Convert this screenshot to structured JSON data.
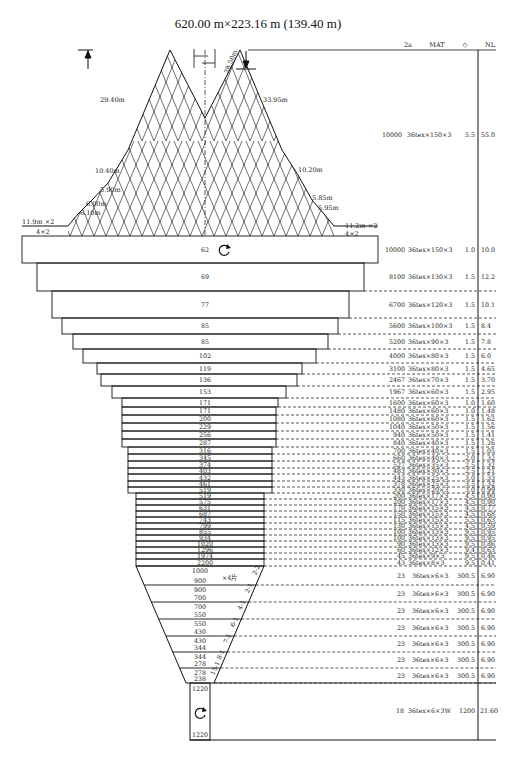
{
  "title": "620.00 m×223.16 m (139.40 m)",
  "table_header": {
    "col_2a": "2a",
    "col_mat": "MAT",
    "col_diamond": "◇",
    "col_nl": "NL"
  },
  "wing_labels": {
    "left": [
      "29.40m",
      "10.40m",
      "5.90m",
      "6.00m",
      "6.10m",
      "11.9m ×2",
      "4×2"
    ],
    "right": [
      "33.95m",
      "10.20m",
      "5.85m",
      "5.95m",
      "11.2m ×2",
      "4×2"
    ],
    "center": "28.50m"
  },
  "wing_row": {
    "a2": "10000",
    "mat": "36tex×150×3",
    "d": "5.5",
    "nl": "55.0"
  },
  "body_sections": [
    {
      "mesh": "62",
      "a2": "10000",
      "mat": "36tex×150×3",
      "d": "1.0",
      "nl": "10.0"
    },
    {
      "mesh": "69",
      "a2": "8100",
      "mat": "36tex×130×3",
      "d": "1.5",
      "nl": "12.2"
    },
    {
      "mesh": "77",
      "a2": "6700",
      "mat": "36tex×120×3",
      "d": "1.5",
      "nl": "10.1"
    },
    {
      "mesh": "85",
      "a2": "5600",
      "mat": "36tex×100×3",
      "d": "1.5",
      "nl": "8.4"
    },
    {
      "mesh": "85",
      "a2": "5200",
      "mat": "36tex×90×3",
      "d": "1.5",
      "nl": "7.8"
    },
    {
      "mesh": "102",
      "a2": "4000",
      "mat": "36tex×80×3",
      "d": "1.5",
      "nl": "6.0"
    },
    {
      "mesh": "119",
      "a2": "3100",
      "mat": "36tex×80×3",
      "d": "1.5",
      "nl": "4.65"
    },
    {
      "mesh": "136",
      "a2": "2467",
      "mat": "36tex×70×3",
      "d": "1.5",
      "nl": "3.70"
    },
    {
      "mesh": "153",
      "a2": "1967",
      "mat": "36tex×60×3",
      "d": "1.5",
      "nl": "2.95"
    },
    {
      "mesh": "171",
      "a2": "1600",
      "mat": "36tex×60×3",
      "d": "1.0",
      "nl": "1.60"
    },
    {
      "mesh": "171",
      "a2": "1480",
      "mat": "36tex×60×3",
      "d": "1.0",
      "nl": "1.48"
    },
    {
      "mesh": "200",
      "a2": "1080",
      "mat": "36tex×60×3",
      "d": "1.5",
      "nl": "1.62"
    },
    {
      "mesh": "229",
      "a2": "1040",
      "mat": "36tex×50×3",
      "d": "1.5",
      "nl": "1.56"
    },
    {
      "mesh": "256",
      "a2": "940",
      "mat": "36tex×50×3",
      "d": "1.5",
      "nl": "1.41"
    },
    {
      "mesh": "287",
      "a2": "840",
      "mat": "36tex×40×3",
      "d": "1.5",
      "nl": "1.26"
    },
    {
      "mesh": "316",
      "a2": "700",
      "mat": "36tex×40×3",
      "d": "1.5",
      "nl": "1.05"
    },
    {
      "mesh": "345",
      "a2": "660",
      "mat": "36tex×40×3",
      "d": "2.0",
      "nl": "1.32"
    },
    {
      "mesh": "374",
      "a2": "527",
      "mat": "36tex×35×3",
      "d": "2.5",
      "nl": "1.32"
    },
    {
      "mesh": "403",
      "a2": "483",
      "mat": "36tex×30×3",
      "d": "2.5",
      "nl": "1.21"
    },
    {
      "mesh": "432",
      "a2": "443",
      "mat": "36tex×25×3",
      "d": "3.0",
      "nl": "1.33"
    },
    {
      "mesh": "461",
      "a2": "378",
      "mat": "36tex×25×3",
      "d": "3.5",
      "nl": "1.32"
    },
    {
      "mesh": "519",
      "a2": "330",
      "mat": "36tex×20×3",
      "d": "3.0",
      "nl": "0.99"
    },
    {
      "mesh": "519",
      "a2": "200",
      "mat": "36tex×17×3",
      "d": "4.5",
      "nl": "0.90"
    },
    {
      "mesh": "575",
      "a2": "200",
      "mat": "36tex×17×3",
      "d": "4.5",
      "nl": "0.90"
    },
    {
      "mesh": "631",
      "a2": "170",
      "mat": "36tex×15×3",
      "d": "4.5",
      "nl": "0.77"
    },
    {
      "mesh": "687",
      "a2": "150",
      "mat": "36tex×15×3",
      "d": "4.5",
      "nl": "0.68"
    },
    {
      "mesh": "743",
      "a2": "115",
      "mat": "36tex×15×3",
      "d": "5.5",
      "nl": "0.63"
    },
    {
      "mesh": "799",
      "a2": "130",
      "mat": "36tex×15×3",
      "d": "4.5",
      "nl": "0.59"
    },
    {
      "mesh": "855",
      "a2": "100",
      "mat": "36tex×13×3",
      "d": "9.5",
      "nl": "0.95"
    },
    {
      "mesh": "934",
      "a2": "100",
      "mat": "36tex×13×3",
      "d": "9.5",
      "nl": "0.95"
    },
    {
      "mesh": "1020",
      "a2": "90",
      "mat": "36tex×13×3",
      "d": "9.5",
      "nl": "0.86"
    },
    {
      "mesh": "1296",
      "a2": "60",
      "mat": "36tex×12×3",
      "d": "9.4",
      "nl": "0.63"
    },
    {
      "mesh": "1974",
      "a2": "45",
      "mat": "36tex×9×3",
      "d": "9.5",
      "nl": "0.46"
    },
    {
      "mesh": "2200",
      "a2": "43",
      "mat": "36tex×8×3",
      "d": "9.5",
      "nl": "0.41"
    }
  ],
  "extension_sections": [
    {
      "top": "1000",
      "bottom": "900",
      "note": "×4片",
      "taper": "2-2",
      "a2": "23",
      "mat": "36tex×6×3",
      "d": "300.5",
      "nl": "6.90"
    },
    {
      "top": "900",
      "bottom": "700",
      "taper": "2-1",
      "a2": "23",
      "mat": "36tex×6×3",
      "d": "300.5",
      "nl": "6.90"
    },
    {
      "top": "700",
      "bottom": "550",
      "taper": "4-1",
      "a2": "23",
      "mat": "36tex×6×3",
      "d": "300.5",
      "nl": "6.90"
    },
    {
      "top": "550",
      "bottom": "430",
      "taper": "6-1",
      "a2": "23",
      "mat": "36tex×6×3",
      "d": "300.5",
      "nl": "6.90"
    },
    {
      "top": "430",
      "bottom": "344",
      "taper": "7-1",
      "a2": "23",
      "mat": "36tex×6×3",
      "d": "300.5",
      "nl": "6.90"
    },
    {
      "top": "344",
      "bottom": "278",
      "taper": "8-1",
      "a2": "23",
      "mat": "36tex×6×3",
      "d": "300.5",
      "nl": "6.90"
    },
    {
      "top": "278",
      "bottom": "238",
      "taper": "15-1",
      "a2": "23",
      "mat": "36tex×6×3",
      "d": "300.5",
      "nl": "6.90"
    }
  ],
  "codend": {
    "top": "1220",
    "bottom": "1220",
    "a2": "18",
    "mat": "36tex×6×3W",
    "d": "1200",
    "nl": "21.60"
  }
}
